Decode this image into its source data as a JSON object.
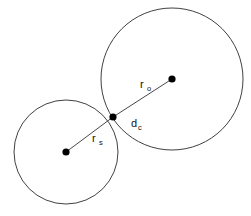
{
  "figure": {
    "type": "geometry-diagram",
    "background_color": "#ffffff",
    "stroke_color": "#2b2b2b",
    "dot_color": "#000000",
    "width": 251,
    "height": 216
  },
  "shapes": {
    "small_circle": {
      "name": "small-circle",
      "cx": 66,
      "cy": 152,
      "r": 52
    },
    "large_circle": {
      "name": "large-circle",
      "cx": 172,
      "cy": 79,
      "r": 71
    }
  },
  "points": {
    "small_center": {
      "label": "",
      "cx": 66,
      "cy": 152,
      "r": 3.6
    },
    "large_center": {
      "label": "",
      "cx": 172,
      "cy": 79,
      "r": 3.6
    },
    "tangent_point": {
      "label": "",
      "cx": 113,
      "cy": 117,
      "r": 3.6
    }
  },
  "segments": {
    "small_radius": {
      "x1": 66,
      "y1": 152,
      "x2": 113,
      "y2": 117
    },
    "large_radius": {
      "x1": 113,
      "y1": 117,
      "x2": 172,
      "y2": 79
    }
  },
  "labels": {
    "r_outer": {
      "base": "r",
      "sub": "o",
      "x": 140,
      "y": 88,
      "sub_x": 147,
      "sub_y": 91
    },
    "d_contact": {
      "base": "d",
      "sub": "c",
      "x": 131,
      "y": 127,
      "sub_x": 138,
      "sub_y": 130
    },
    "r_small": {
      "base": "r",
      "sub": "s",
      "x": 92,
      "y": 142,
      "sub_x": 99,
      "sub_y": 145
    }
  }
}
